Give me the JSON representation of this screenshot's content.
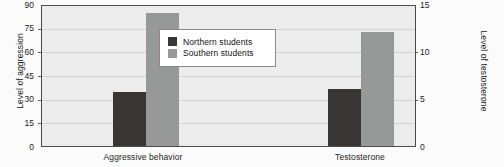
{
  "chart_data": {
    "type": "bar",
    "title": "",
    "categories": [
      "Aggressive behavior",
      "Testosterone"
    ],
    "series": [
      {
        "name": "Northern students",
        "color": "#3a3634",
        "values": [
          34,
          6
        ]
      },
      {
        "name": "Southern students",
        "color": "#979998",
        "values": [
          84,
          12
        ]
      }
    ],
    "axes": {
      "left": {
        "label": "Level of aggression",
        "ticks": [
          "0",
          "15",
          "30",
          "45",
          "60",
          "75",
          "90"
        ],
        "tick_values": [
          0,
          15,
          30,
          45,
          60,
          75,
          90
        ],
        "min": 0,
        "max": 90,
        "applies_to_category": "Aggressive behavior"
      },
      "right": {
        "label": "Level of testosterone",
        "ticks": [
          "0",
          "5",
          "10",
          "15"
        ],
        "tick_values": [
          0,
          5,
          10,
          15
        ],
        "min": 0,
        "max": 15,
        "applies_to_category": "Testosterone"
      }
    },
    "legend": {
      "position": "inside-top-center",
      "entries": [
        {
          "label": "Northern students",
          "color": "#3a3634"
        },
        {
          "label": "Southern students",
          "color": "#979998"
        }
      ]
    },
    "grid": {
      "horizontal": true,
      "vertical": false
    },
    "plot_background": "#ececec"
  }
}
